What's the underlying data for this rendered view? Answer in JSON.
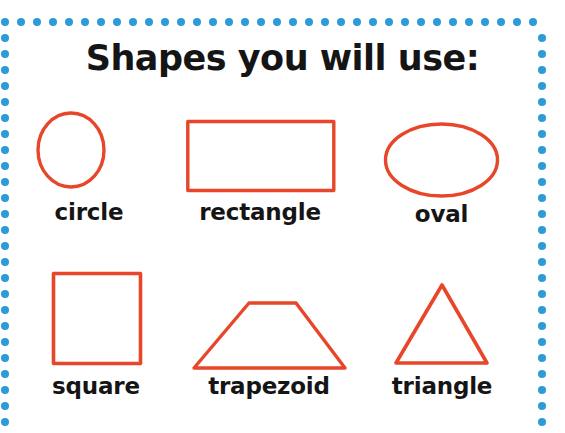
{
  "poster": {
    "title": "Shapes you will use:",
    "background_color": "#ffffff",
    "border": {
      "style": "dotted",
      "dot_color": "#2e9bd8",
      "dot_diameter_px": 8,
      "dot_pitch_px": 16,
      "sides": [
        "top",
        "left",
        "right"
      ]
    },
    "shape_stroke_color": "#e8462a",
    "text_color": "#151515"
  },
  "rows": [
    {
      "items": [
        {
          "label": "circle",
          "icon": "circle-shape"
        },
        {
          "label": "rectangle",
          "icon": "rectangle-shape"
        },
        {
          "label": "oval",
          "icon": "oval-shape"
        }
      ]
    },
    {
      "items": [
        {
          "label": "square",
          "icon": "square-shape"
        },
        {
          "label": "trapezoid",
          "icon": "trapezoid-shape"
        },
        {
          "label": "triangle",
          "icon": "triangle-shape"
        }
      ]
    }
  ]
}
